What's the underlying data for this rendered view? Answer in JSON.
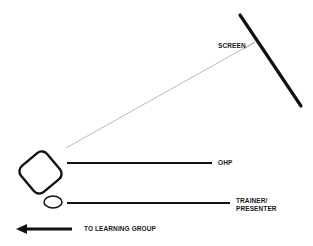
{
  "diagram": {
    "type": "room layout",
    "labels": {
      "screen": "SCREEN",
      "ohp": "OHP",
      "trainer_line1": "TRAINER/",
      "trainer_line2": "PRESENTER",
      "learning_group": "TO LEARNING GROUP"
    },
    "elements": [
      {
        "id": "screen",
        "shape": "thick line",
        "label": "SCREEN"
      },
      {
        "id": "ohp",
        "shape": "rounded square",
        "label": "OHP"
      },
      {
        "id": "projection-beam",
        "shape": "thin line",
        "from": "ohp",
        "to": "screen"
      },
      {
        "id": "trainer",
        "shape": "ellipse",
        "label": "TRAINER/ PRESENTER"
      },
      {
        "id": "direction-arrow",
        "shape": "arrow",
        "direction": "left",
        "label": "TO LEARNING GROUP"
      }
    ],
    "colors": {
      "stroke": "#111111",
      "beam": "#9a9a9a",
      "background": "#ffffff"
    }
  }
}
